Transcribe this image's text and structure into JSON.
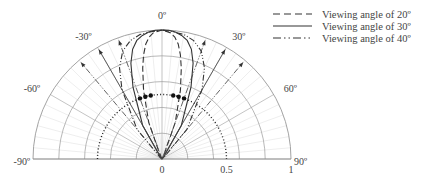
{
  "chart_data": {
    "type": "polar",
    "title": "",
    "angle_range_deg": [
      -90,
      90
    ],
    "angle_ticks": [
      {
        "deg": 0,
        "label": "0º"
      },
      {
        "deg": -30,
        "label": "-30º"
      },
      {
        "deg": 30,
        "label": "30º"
      },
      {
        "deg": -60,
        "label": "-60º"
      },
      {
        "deg": 60,
        "label": "60º"
      },
      {
        "deg": -90,
        "label": "-90º"
      },
      {
        "deg": 90,
        "label": "90º"
      }
    ],
    "radial_ticks": [
      {
        "r": 0,
        "label": "0"
      },
      {
        "r": 0.5,
        "label": "0.5"
      },
      {
        "r": 1,
        "label": "1"
      }
    ],
    "radial_range": [
      0,
      1
    ],
    "grid_rings": [
      0.2,
      0.4,
      0.6,
      0.8,
      1.0
    ],
    "grid_spoke_step_deg": 5,
    "half_intensity_ring": 0.5,
    "legend": [
      {
        "name": "Viewing angle of 20º",
        "style": "dashed"
      },
      {
        "name": "Viewing angle of 30º",
        "style": "solid"
      },
      {
        "name": "Viewing angle of 40º",
        "style": "dashdotdot"
      }
    ],
    "series": [
      {
        "name": "Viewing angle of 20º",
        "style": "dashed",
        "angles": [
          -90,
          -30,
          -20,
          -15,
          -12,
          -10,
          -8,
          -6,
          -4,
          -2,
          0,
          2,
          4,
          6,
          8,
          10,
          12,
          15,
          20,
          30,
          90
        ],
        "values": [
          0,
          0.02,
          0.3,
          0.55,
          0.72,
          0.82,
          0.9,
          0.95,
          0.98,
          0.99,
          1.0,
          0.99,
          0.98,
          0.95,
          0.9,
          0.82,
          0.72,
          0.55,
          0.3,
          0.02,
          0
        ]
      },
      {
        "name": "Viewing angle of 30º",
        "style": "solid",
        "angles": [
          -90,
          -40,
          -30,
          -22,
          -18,
          -15,
          -12,
          -9,
          -6,
          -3,
          0,
          3,
          6,
          9,
          12,
          15,
          18,
          22,
          30,
          40,
          90
        ],
        "values": [
          0,
          0.02,
          0.3,
          0.6,
          0.78,
          0.88,
          0.94,
          0.97,
          0.99,
          1.0,
          1.0,
          1.0,
          0.99,
          0.97,
          0.94,
          0.88,
          0.78,
          0.6,
          0.3,
          0.02,
          0
        ]
      },
      {
        "name": "Viewing angle of 40º",
        "style": "dashdotdot",
        "angles": [
          -90,
          -50,
          -40,
          -30,
          -25,
          -20,
          -15,
          -10,
          -5,
          0,
          5,
          10,
          15,
          20,
          25,
          30,
          40,
          50,
          90
        ],
        "values": [
          0,
          0.02,
          0.3,
          0.62,
          0.78,
          0.89,
          0.95,
          0.98,
          0.99,
          1.0,
          0.99,
          0.98,
          0.95,
          0.89,
          0.78,
          0.62,
          0.3,
          0.02,
          0
        ]
      }
    ],
    "half_intensity_markers": [
      {
        "series": "Viewing angle of 20º",
        "deg": [
          -10,
          10
        ]
      },
      {
        "series": "Viewing angle of 30º",
        "deg": [
          -15,
          15
        ]
      },
      {
        "series": "Viewing angle of 40º",
        "deg": [
          -20,
          20
        ]
      }
    ],
    "arrows_deg": [
      -40,
      -30,
      -20,
      20,
      30,
      40
    ]
  }
}
